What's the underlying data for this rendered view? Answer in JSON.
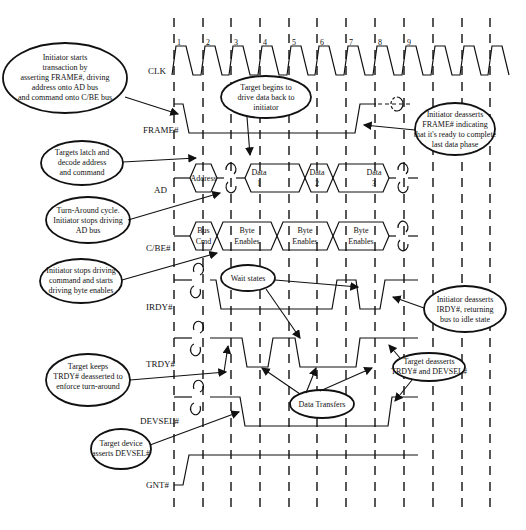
{
  "diagram": {
    "type": "timing-diagram",
    "title": "",
    "signals": [
      {
        "name": "CLK",
        "label": "CLK"
      },
      {
        "name": "FRAME#",
        "label": "FRAME#"
      },
      {
        "name": "AD",
        "label": "AD"
      },
      {
        "name": "C/BE#",
        "label": "C/BE#"
      },
      {
        "name": "IRDY#",
        "label": "IRDY#"
      },
      {
        "name": "TRDY#",
        "label": "TRDY#"
      },
      {
        "name": "DEVSEL#",
        "label": "DEVSEL#"
      },
      {
        "name": "GNT#",
        "label": "GNT#"
      }
    ],
    "clock_numbers": [
      "1",
      "2",
      "3",
      "4",
      "5",
      "6",
      "7",
      "8",
      "9"
    ],
    "ad_bus": {
      "address": "Address",
      "data1": [
        "Data",
        "1"
      ],
      "data2": [
        "Data",
        "2"
      ],
      "data3": [
        "Data",
        "3"
      ]
    },
    "cbe_bus": {
      "cmd": [
        "Bus",
        "Cmd"
      ],
      "be1": [
        "Byte",
        "Enables"
      ],
      "be2": [
        "Byte",
        "Enables"
      ],
      "be3": [
        "Byte",
        "Enables"
      ]
    },
    "annotations": {
      "initiator_starts": [
        "Initiator starts",
        "transaction by",
        "asserting FRAME#, driving",
        "address onto AD bus",
        "and command onto C/BE bus"
      ],
      "target_begins": [
        "Target begins to",
        "drive data back to",
        "initiator"
      ],
      "initiator_deasserts_frame": [
        "Initiator deasserts",
        "FRAME# indicating",
        "that it's ready to complete",
        "last data phase"
      ],
      "targets_latch": [
        "Targets latch and",
        "decode address",
        "and command"
      ],
      "turn_around": [
        "Turn-Around cycle.",
        "Initiator stops driving",
        "AD bus"
      ],
      "initiator_stops_cmd": [
        "Initiator stops driving",
        "command and starts",
        "driving byte enables"
      ],
      "wait_states": [
        "Wait states"
      ],
      "initiator_deasserts_irdy": [
        "Initiator deasserts",
        "IRDY#, returning",
        "bus to idle state"
      ],
      "target_keeps_trdy": [
        "Target keeps",
        "TRDY# deasserted to",
        "enforce turn-around",
        "cycle"
      ],
      "target_deasserts": [
        "Target deasserts",
        "TRDY# and DEVSEL#"
      ],
      "data_transfers": [
        "Data Transfers"
      ],
      "target_device_asserts": [
        "Target device",
        "asserts DEVSEL#"
      ]
    }
  }
}
